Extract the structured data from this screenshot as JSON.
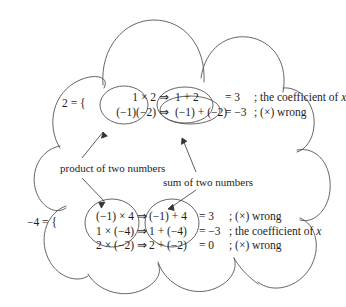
{
  "figure": {
    "ink_color": "#555555",
    "text_color": "#1d1d1d",
    "background": "#ffffff"
  },
  "annotations": {
    "product_label": "product of two numbers",
    "sum_label": "sum of two numbers"
  },
  "top_block": {
    "lhs": "2 = {",
    "rows": [
      {
        "product": "1 × 2",
        "arrow": "⇒",
        "sum": "1 + 2",
        "equals": "= 3",
        "semicolon": ";",
        "comment": "the coefficient of",
        "comment_var": "x"
      },
      {
        "product": "(−1)(−2)",
        "arrow": "⇒",
        "sum": "(−1) + (−2)",
        "equals": "= −3",
        "semicolon": ";",
        "comment": "(×) wrong",
        "comment_var": ""
      }
    ]
  },
  "bottom_block": {
    "lhs": "−4 = {",
    "rows": [
      {
        "product": "(−1) × 4",
        "arrow": "⇒",
        "sum": "(−1) + 4",
        "equals": "= 3",
        "semicolon": ";",
        "comment": "(×)  wrong",
        "comment_var": ""
      },
      {
        "product": "1 × (−4)",
        "arrow": "⇒",
        "sum": "1 + (−4)",
        "equals": "= −3",
        "semicolon": ";",
        "comment": "the coefficient of",
        "comment_var": "x"
      },
      {
        "product": "2 × (−2)",
        "arrow": "⇒",
        "sum": "2 + (−2)",
        "equals": "= 0",
        "semicolon": ";",
        "comment": "(×)  wrong",
        "comment_var": ""
      }
    ]
  }
}
